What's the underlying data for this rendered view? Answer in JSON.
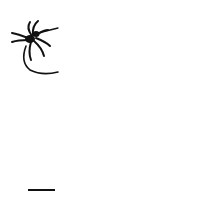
{
  "figure": {
    "elements": [
      "spider-icon",
      "warp-threads",
      "weft-thread"
    ],
    "warp_count": 12,
    "weft_rows": 10,
    "colors": {
      "ink": "#111111",
      "background": "#ffffff"
    }
  }
}
